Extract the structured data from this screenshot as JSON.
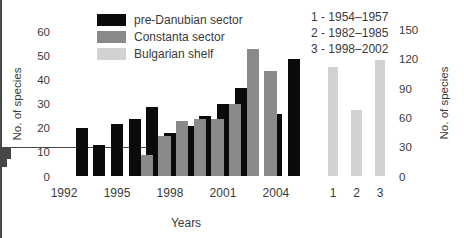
{
  "figure": {
    "background": "#ffffff"
  },
  "colors": {
    "pre_danubian": "#0b0b0b",
    "constanta": "#8a8a8a",
    "bulgarian": "#d2d2d2",
    "axis": "#474747",
    "text": "#3a3a3a"
  },
  "chart_data": [
    {
      "type": "bar",
      "title": "",
      "xlabel": "Years",
      "ylabel": "No. of species",
      "ylim": [
        0,
        60
      ],
      "y_major_tick_step": 10,
      "y_minor_tick_step": 5,
      "x_range": [
        1992,
        2006
      ],
      "x_labeled_ticks": [
        1992,
        1995,
        1998,
        2001,
        2004
      ],
      "grid": false,
      "legend_position": "top",
      "series": [
        {
          "name": "pre-Danubian sector",
          "color": "#0b0b0b",
          "data": [
            {
              "year": 1993,
              "value": 20
            },
            {
              "year": 1994,
              "value": 13
            },
            {
              "year": 1995,
              "value": 22
            },
            {
              "year": 1996,
              "value": 24
            },
            {
              "year": 1997,
              "value": 29
            },
            {
              "year": 1998,
              "value": 18
            },
            {
              "year": 1999,
              "value": 21
            },
            {
              "year": 2000,
              "value": 25
            },
            {
              "year": 2001,
              "value": 30
            },
            {
              "year": 2002,
              "value": 37
            },
            {
              "year": 2004,
              "value": 26
            },
            {
              "year": 2005,
              "value": 49
            }
          ]
        },
        {
          "name": "Constanta sector",
          "color": "#8a8a8a",
          "data": [
            {
              "year": 1996,
              "value": 9
            },
            {
              "year": 1997,
              "value": 17
            },
            {
              "year": 1998,
              "value": 23
            },
            {
              "year": 1999,
              "value": 24
            },
            {
              "year": 2000,
              "value": 24
            },
            {
              "year": 2001,
              "value": 30
            },
            {
              "year": 2002,
              "value": 53
            },
            {
              "year": 2003,
              "value": 44
            }
          ]
        },
        {
          "name": "Bulgarian shelf",
          "color": "#d2d2d2",
          "data": []
        }
      ]
    },
    {
      "type": "bar",
      "title": "",
      "xlabel": "",
      "ylabel": "No. of species",
      "ylim": [
        0,
        150
      ],
      "y_major_tick_step": 30,
      "y_minor_tick_step": 15,
      "axis_side": "right",
      "grid": false,
      "categories": [
        "1",
        "2",
        "3"
      ],
      "values": [
        112,
        68,
        119
      ],
      "bar_color": "#d2d2d2",
      "legend_lines": [
        "1 - 1954–1957",
        "2 - 1982–1985",
        "3 - 1998–2002"
      ]
    }
  ]
}
